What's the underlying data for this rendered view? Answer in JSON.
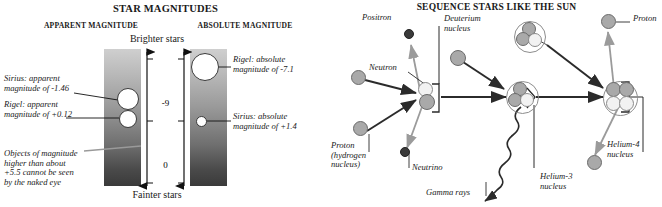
{
  "left_panel": {
    "title": "STAR MAGNITUDES",
    "column_headers": {
      "apparent": "APPARENT MAGNITUDE",
      "absolute": "ABSOLUTE MAGNITUDE"
    },
    "axis": {
      "top_label": "Brighter stars",
      "bottom_label": "Fainter stars",
      "ticks": [
        "-9",
        "0",
        "+9"
      ]
    },
    "annotations": {
      "sirius_apparent": [
        "Sirius: apparent",
        "magnitude of -1.46"
      ],
      "rigel_apparent": [
        "Rigel: apparent",
        "magnitude of +0.12"
      ],
      "naked_eye": [
        "Objects of magnitude",
        "higher than about",
        "+5.5 cannot be seen",
        "by the naked eye"
      ],
      "rigel_absolute": [
        "Rigel: absolute",
        "magnitude of -7.1"
      ],
      "sirius_absolute": [
        "Sirius: absolute",
        "magnitude of +1.4"
      ]
    },
    "data_values": {
      "sirius_apparent_magnitude": "-1.46",
      "rigel_apparent_magnitude": "+0.12",
      "rigel_absolute_magnitude": "-7.1",
      "sirius_absolute_magnitude": "+1.4",
      "naked_eye_limit": "+5.5"
    }
  },
  "right_panel": {
    "title": "SEQUENCE STARS LIKE THE SUN",
    "labels": {
      "positron": "Positron",
      "deuterium": [
        "Deuterium",
        "nucleus"
      ],
      "proton_top_right": "Proton",
      "neutron": "Neutron",
      "proton_hydrogen": [
        "Proton",
        "(hydrogen",
        "nucleus)"
      ],
      "neutrino": "Neutrino",
      "gamma_rays": "Gamma rays",
      "helium3": [
        "Helium-3",
        "nucleus"
      ],
      "helium4": [
        "Helium-4",
        "nucleus"
      ]
    }
  },
  "colors": {
    "proton": "#a9a9a9",
    "neutron": "#f2f2f2",
    "particle_dark": "#3a3a3a",
    "arrow_dark": "#2b2b2b",
    "arrow_light": "#9b9b9b",
    "text": "#1a1a1a",
    "background": "#ffffff"
  }
}
